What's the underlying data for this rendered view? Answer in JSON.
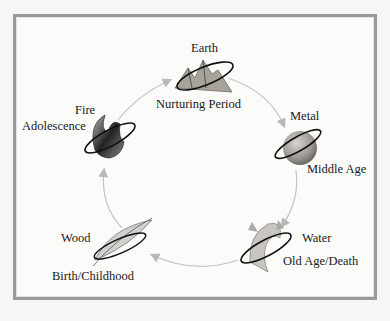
{
  "diagram": {
    "type": "cycle",
    "title": "",
    "frame_color": "#9a9a9a",
    "arrow_color": "#b8b8b8",
    "nodes": [
      {
        "element": "Earth",
        "stage": "Nurturing Period",
        "icon": "mountain-icon"
      },
      {
        "element": "Metal",
        "stage": "Middle Age",
        "icon": "metal-sphere-icon"
      },
      {
        "element": "Water",
        "stage": "Old Age/Death",
        "icon": "water-wave-icon"
      },
      {
        "element": "Wood",
        "stage": "Birth/Childhood",
        "icon": "leaf-icon"
      },
      {
        "element": "Fire",
        "stage": "Adolescence",
        "icon": "flame-icon"
      }
    ],
    "edges": [
      {
        "from": "Earth",
        "to": "Metal"
      },
      {
        "from": "Metal",
        "to": "Water"
      },
      {
        "from": "Water",
        "to": "Wood"
      },
      {
        "from": "Wood",
        "to": "Fire"
      },
      {
        "from": "Fire",
        "to": "Earth"
      }
    ]
  }
}
